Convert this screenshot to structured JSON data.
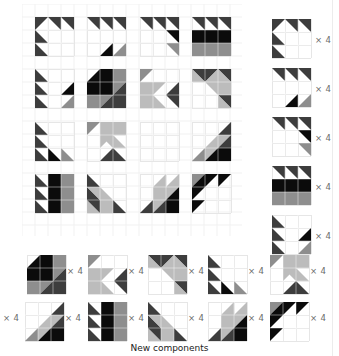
{
  "shades": {
    "K": "#0b0b0b",
    "D": "#3d3d3d",
    "M": "#8e8e8e",
    "L": "#bcbcbc"
  },
  "cell_grid_color": "#e6e6e6",
  "caption": "New components",
  "multiplier_label": "× 4",
  "grid_blocks": [
    [
      {
        "name": "block-r1-c1",
        "cells": [
          [
            0,
            0,
            "tl",
            "D"
          ],
          [
            1,
            0,
            "tr",
            "D"
          ],
          [
            2,
            0,
            "tr",
            "D"
          ],
          [
            0,
            1,
            "bl",
            "D"
          ],
          [
            0,
            2,
            "bl",
            "D"
          ]
        ]
      },
      {
        "name": "block-r1-c2",
        "cells": [
          [
            0,
            0,
            "tr",
            "D"
          ],
          [
            1,
            0,
            "tr",
            "D"
          ],
          [
            2,
            0,
            "tr",
            "D"
          ],
          [
            1,
            2,
            "br",
            "K"
          ],
          [
            2,
            2,
            "br",
            "M"
          ]
        ]
      },
      {
        "name": "block-r1-c3",
        "cells": [
          [
            0,
            0,
            "tr",
            "D"
          ],
          [
            1,
            0,
            "tr",
            "D"
          ],
          [
            2,
            0,
            "tr",
            "D"
          ],
          [
            2,
            1,
            "tr",
            "K"
          ],
          [
            2,
            2,
            "tr",
            "M"
          ]
        ]
      },
      {
        "name": "block-r1-c4",
        "cells": [
          [
            0,
            0,
            "tr",
            "D"
          ],
          [
            1,
            0,
            "tr",
            "D"
          ],
          [
            2,
            0,
            "tr",
            "D"
          ],
          [
            0,
            1,
            "full",
            "K"
          ],
          [
            1,
            1,
            "full",
            "K"
          ],
          [
            2,
            1,
            "full",
            "K"
          ],
          [
            0,
            2,
            "full",
            "M"
          ],
          [
            1,
            2,
            "full",
            "M"
          ],
          [
            2,
            2,
            "full",
            "M"
          ]
        ]
      }
    ],
    [
      {
        "name": "block-r2-c1",
        "cells": [
          [
            0,
            0,
            "bl",
            "D"
          ],
          [
            0,
            1,
            "bl",
            "D"
          ],
          [
            0,
            2,
            "bl",
            "D"
          ],
          [
            2,
            1,
            "br",
            "K"
          ],
          [
            2,
            2,
            "br",
            "M"
          ]
        ]
      },
      {
        "name": "block-r2-c2",
        "cells": [
          [
            0,
            0,
            "br",
            "K"
          ],
          [
            1,
            0,
            "full",
            "K"
          ],
          [
            2,
            0,
            "full",
            "M"
          ],
          [
            0,
            1,
            "full",
            "K"
          ],
          [
            1,
            1,
            "full",
            "K"
          ],
          [
            2,
            1,
            "split-br",
            "M",
            "D"
          ],
          [
            0,
            2,
            "full",
            "M"
          ],
          [
            1,
            2,
            "split-br",
            "M",
            "D"
          ],
          [
            2,
            2,
            "full",
            "D"
          ]
        ]
      },
      {
        "name": "block-r2-c3",
        "cells": [
          [
            0,
            0,
            "tl",
            "M"
          ],
          [
            0,
            1,
            "full",
            "L"
          ],
          [
            1,
            1,
            "tl",
            "L"
          ],
          [
            0,
            2,
            "full",
            "L"
          ],
          [
            1,
            2,
            "bl",
            "L"
          ],
          [
            2,
            1,
            "br",
            "D"
          ],
          [
            2,
            2,
            "tr",
            "D"
          ]
        ]
      },
      {
        "name": "block-r2-c4",
        "cells": [
          [
            0,
            0,
            "split-tr",
            "D",
            "L"
          ],
          [
            1,
            0,
            "split-tl2",
            "D",
            "L"
          ],
          [
            2,
            0,
            "split-tr",
            "D",
            "L"
          ],
          [
            1,
            1,
            "tr",
            "L"
          ],
          [
            2,
            1,
            "full",
            "L"
          ],
          [
            2,
            2,
            "split-tr",
            "D",
            "L"
          ]
        ]
      }
    ],
    [
      {
        "name": "block-r3-c1",
        "cells": [
          [
            0,
            0,
            "bl",
            "D"
          ],
          [
            0,
            1,
            "bl",
            "D"
          ],
          [
            0,
            2,
            "bl",
            "D"
          ],
          [
            1,
            2,
            "bl",
            "K"
          ],
          [
            2,
            2,
            "bl",
            "M"
          ]
        ]
      },
      {
        "name": "block-r3-c2",
        "cells": [
          [
            0,
            0,
            "tl",
            "M"
          ],
          [
            1,
            0,
            "full",
            "L"
          ],
          [
            2,
            0,
            "full",
            "L"
          ],
          [
            1,
            1,
            "split-tent",
            "L"
          ],
          [
            2,
            1,
            "bl2",
            "L"
          ],
          [
            1,
            2,
            "br",
            "D"
          ],
          [
            2,
            2,
            "bl",
            "D"
          ]
        ]
      },
      {
        "name": "block-r3-c3",
        "cells": []
      },
      {
        "name": "block-r3-c4",
        "cells": [
          [
            2,
            0,
            "br",
            "D"
          ],
          [
            1,
            1,
            "br",
            "L"
          ],
          [
            2,
            1,
            "split-tl",
            "L",
            "D"
          ],
          [
            0,
            2,
            "br",
            "M"
          ],
          [
            1,
            2,
            "split-tl",
            "L",
            "K"
          ],
          [
            2,
            2,
            "full",
            "K"
          ]
        ]
      }
    ],
    [
      {
        "name": "block-r4-c1",
        "cells": [
          [
            0,
            0,
            "bl",
            "D"
          ],
          [
            0,
            1,
            "bl",
            "D"
          ],
          [
            0,
            2,
            "bl",
            "D"
          ],
          [
            1,
            0,
            "full",
            "K"
          ],
          [
            1,
            1,
            "full",
            "K"
          ],
          [
            1,
            2,
            "full",
            "K"
          ],
          [
            2,
            0,
            "full",
            "M"
          ],
          [
            2,
            1,
            "full",
            "M"
          ],
          [
            2,
            2,
            "full",
            "M"
          ]
        ]
      },
      {
        "name": "block-r4-c2",
        "cells": [
          [
            0,
            0,
            "bl",
            "D"
          ],
          [
            0,
            1,
            "split-bl",
            "D",
            "L"
          ],
          [
            1,
            1,
            "bl",
            "L"
          ],
          [
            0,
            2,
            "split-bl",
            "L",
            "D"
          ],
          [
            1,
            2,
            "full",
            "L"
          ],
          [
            2,
            2,
            "bl",
            "D"
          ]
        ]
      },
      {
        "name": "block-r4-c3",
        "cells": [
          [
            1,
            0,
            "br",
            "L"
          ],
          [
            2,
            0,
            "br",
            "L"
          ],
          [
            1,
            1,
            "full",
            "L"
          ],
          [
            2,
            1,
            "split-tl",
            "L",
            "K"
          ],
          [
            0,
            2,
            "br",
            "D"
          ],
          [
            1,
            2,
            "split-tl",
            "L",
            "D"
          ],
          [
            2,
            2,
            "full",
            "K"
          ]
        ]
      },
      {
        "name": "block-r4-c4",
        "cells": [
          [
            0,
            0,
            "split-tl",
            "M",
            "K"
          ],
          [
            1,
            0,
            "tl",
            "K"
          ],
          [
            2,
            0,
            "tl",
            "K"
          ],
          [
            0,
            1,
            "tl",
            "K"
          ],
          [
            0,
            2,
            "tl",
            "K"
          ]
        ]
      }
    ]
  ],
  "side_blocks": [
    {
      "name": "side-block-1",
      "ref": "block-r1-c1"
    },
    {
      "name": "side-block-2",
      "ref": "block-r1-c2"
    },
    {
      "name": "side-block-3",
      "ref": "block-r1-c3"
    },
    {
      "name": "side-block-4",
      "ref": "block-r1-c4"
    },
    {
      "name": "side-block-5",
      "ref": "side-5"
    }
  ],
  "extra_blocks": {
    "side-5": [
      [
        0,
        0,
        "bl",
        "D"
      ],
      [
        0,
        1,
        "bl",
        "D"
      ],
      [
        0,
        2,
        "bl",
        "D"
      ],
      [
        2,
        1,
        "br",
        "K"
      ],
      [
        2,
        2,
        "br",
        "M"
      ]
    ]
  },
  "bottom_row_1": [
    "block-r2-c2",
    "block-r2-c3",
    "block-r2-c4",
    "block-r3-c1",
    "block-r3-c2"
  ],
  "bottom_row_2": [
    "block-r3-c4",
    "block-r4-c1",
    "block-r4-c2",
    "block-r4-c3",
    "block-r4-c4"
  ]
}
